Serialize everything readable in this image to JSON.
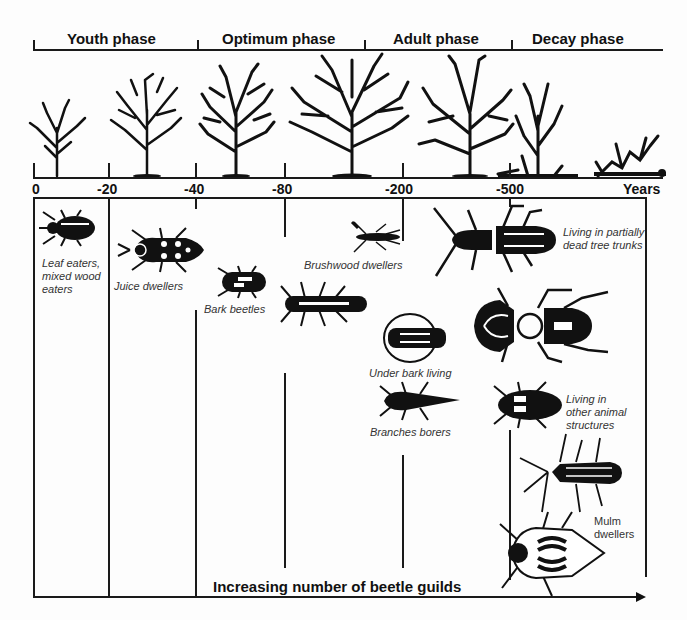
{
  "phases": [
    {
      "label": "Youth phase"
    },
    {
      "label": "Optimum phase"
    },
    {
      "label": "Adult phase"
    },
    {
      "label": "Decay phase"
    }
  ],
  "timeline": {
    "ticks": [
      "0",
      "-20",
      "-40",
      "-80",
      "-200",
      "-500"
    ],
    "unit": "Years"
  },
  "trees": [
    {
      "stage": "sapling"
    },
    {
      "stage": "young-tree"
    },
    {
      "stage": "optimum-tree"
    },
    {
      "stage": "mature-tree"
    },
    {
      "stage": "adult-tree"
    },
    {
      "stage": "dying-tree"
    },
    {
      "stage": "deadwood"
    }
  ],
  "guilds": [
    {
      "label": "Leaf eaters, mixed wood eaters"
    },
    {
      "label": "Juice dwellers"
    },
    {
      "label": "Bark beetles"
    },
    {
      "label": "Brushwood dwellers"
    },
    {
      "label": "Under bark living"
    },
    {
      "label": "Branches borers"
    },
    {
      "label": "Living in partially dead tree trunks"
    },
    {
      "label": "Living in other animal structures"
    },
    {
      "label": "Mulm dwellers"
    }
  ],
  "footer": {
    "axis_label": "Increasing number of beetle guilds"
  }
}
